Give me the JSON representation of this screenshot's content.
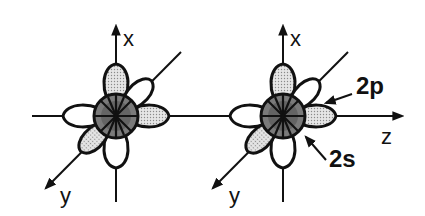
{
  "diagram": {
    "type": "orbital-diagram",
    "atoms": [
      {
        "id": "left-atom",
        "axes": {
          "vertical": "x",
          "diagonal": "y"
        }
      },
      {
        "id": "right-atom",
        "axes": {
          "vertical": "x",
          "diagonal": "y",
          "horizontal": "z"
        }
      }
    ],
    "labels": {
      "left_x": "x",
      "left_y": "y",
      "right_x": "x",
      "right_y": "y",
      "right_z": "z",
      "orbital_2p": "2p",
      "orbital_2s": "2s"
    },
    "colors": {
      "stroke": "#111111",
      "shaded_lobe": "#d0d0d0",
      "open_lobe": "#ffffff",
      "s_orbital_core": "#5a5a5a",
      "s_orbital_inner": "#7a7a7a"
    }
  }
}
